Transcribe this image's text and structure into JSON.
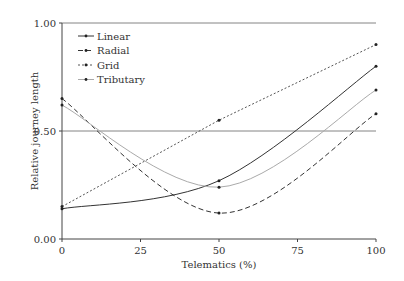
{
  "chart_data": {
    "type": "line",
    "title": "",
    "xlabel": "Telematics (%)",
    "ylabel": "Relative journey length",
    "xlim": [
      0,
      100
    ],
    "ylim": [
      0,
      1
    ],
    "x_ticks": [
      "0",
      "25",
      "50",
      "75",
      "100"
    ],
    "y_ticks": [
      "0.00",
      "0.50",
      "1.00"
    ],
    "grid": "horizontal lines at 0.50 and 1.00",
    "legend_position": "upper left",
    "x": [
      0,
      50,
      100
    ],
    "series": [
      {
        "name": "Linear",
        "style": "solid",
        "color": "#333333",
        "values": [
          0.14,
          0.27,
          0.8
        ]
      },
      {
        "name": "Radial",
        "style": "dashed",
        "color": "#333333",
        "values": [
          0.65,
          0.12,
          0.58
        ]
      },
      {
        "name": "Grid",
        "style": "dotted",
        "color": "#555555",
        "values": [
          0.15,
          0.55,
          0.9
        ]
      },
      {
        "name": "Tributary",
        "style": "solid-light",
        "color": "#aaaaaa",
        "values": [
          0.62,
          0.24,
          0.69
        ]
      }
    ]
  }
}
